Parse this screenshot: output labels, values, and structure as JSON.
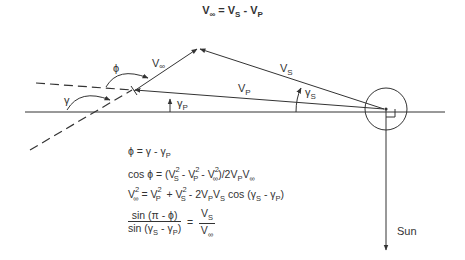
{
  "title": {
    "main": "V",
    "main_sub": "∞",
    "eq": " = ",
    "vs": "V",
    "vs_sub": "S",
    "minus": " - ",
    "vp": "V",
    "vp_sub": "P"
  },
  "labels": {
    "v_inf": "V",
    "v_inf_sub": "∞",
    "v_s": "V",
    "v_s_sub": "S",
    "v_p": "V",
    "v_p_sub": "P",
    "phi": "ϕ",
    "gamma": "γ",
    "gamma_p": "γ",
    "gamma_p_sub": "P",
    "gamma_s": "γ",
    "gamma_s_sub": "S",
    "sun": "Sun"
  },
  "equations": {
    "eq1": {
      "lhs": "ϕ = γ - γ",
      "sub": "P"
    },
    "eq2": {
      "text": "cos ϕ = (V",
      "s1": "S",
      "p1": "2",
      "m1": " - V",
      "s2": "P",
      "p2": "2",
      "m2": " - V",
      "s3": "∞",
      "p3": "2",
      "tail": ")/2V",
      "s4": "P",
      "tail2": "V",
      "s5": "∞"
    },
    "eq3": {
      "lhs": "V",
      "lsub": "∞",
      "lsup": "2",
      "eq": " = V",
      "s1": "P",
      "p1": "2",
      "plus": "  + V",
      "s2": "S",
      "p2": "2",
      "m": " - 2V",
      "s3": "P",
      "v": "V",
      "s4": "S",
      "cos": " cos (γ",
      "s5": "S",
      "m2": " - ",
      "gp": "γ",
      "s6": "P",
      "close": ")"
    },
    "eq4": {
      "num": "sin (π - ϕ)",
      "den_a": "sin (γ",
      "den_s1": "S",
      "den_b": " - γ",
      "den_s2": "P",
      "den_c": ")",
      "eq": " = ",
      "rnum": "V",
      "rnum_sub": "S",
      "rden": "V",
      "rden_sub": "∞"
    }
  },
  "geometry": {
    "baseline": {
      "x1": 25,
      "y1": 112,
      "x2": 445,
      "y2": 112
    },
    "planet_center": [
      386,
      109
    ],
    "planet_radius": 21,
    "apex": [
      198,
      48
    ],
    "vp_tail": [
      134,
      90
    ],
    "sun_arrow_end": [
      386,
      250
    ],
    "color": "#333333"
  }
}
